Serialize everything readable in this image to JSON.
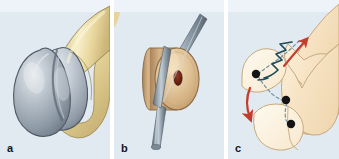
{
  "figure": {
    "background_color": "#ffffff",
    "panel_background_color": "#e1e9f1",
    "width": 339,
    "height": 159
  },
  "panels": [
    {
      "id": "a",
      "label": "a",
      "caption": "Distal femur with articular cartilage defect on condyle",
      "colors": {
        "bone": "#e9d79b",
        "bone_light": "#f5ecc4",
        "bone_shadow": "#c9b478",
        "cartilage": "#9aa5b0",
        "cartilage_light": "#d8dde3",
        "cartilage_shadow": "#6f7a87",
        "outline": "#4a5560"
      },
      "parts": [
        {
          "name": "femoral-shaft",
          "tissue": "bone"
        },
        {
          "name": "medial-condyle",
          "tissue": "cartilage"
        },
        {
          "name": "lateral-condyle",
          "tissue": "cartilage"
        },
        {
          "name": "intercondylar-notch",
          "tissue": "cartilage"
        }
      ]
    },
    {
      "id": "b",
      "label": "b",
      "caption": "Harvested osteochondral plug on delivery tube",
      "colors": {
        "plug_face": "#dcb98d",
        "plug_face_light": "#edd6ae",
        "plug_rim": "#c9a273",
        "plug_center": "#7d2d1c",
        "rod": "#8a99a5",
        "rod_light": "#b7c3cc",
        "rod_shadow": "#5e6d79",
        "outline": "#7c6a4f"
      },
      "parts": [
        {
          "name": "graft-plug-cylinder",
          "tissue": "cancellous-bone"
        },
        {
          "name": "graft-plug-core",
          "tissue": "marrow"
        },
        {
          "name": "delivery-rod",
          "tissue": "instrument"
        }
      ]
    },
    {
      "id": "c",
      "label": "c",
      "caption": "Schematic of graft transfer from donor site to recipient defect",
      "colors": {
        "bone_fill": "#f7e4c5",
        "bone_fill_light": "#fdf3e0",
        "bone_outline": "#c8a97e",
        "arrow_red": "#c33d2c",
        "arrow_teal": "#1f4a58",
        "dot": "#141414",
        "dashed": "#6f93a3"
      },
      "markers": [
        {
          "name": "donor-site-marker-upper",
          "x": 28,
          "y": 74
        },
        {
          "name": "recipient-site-marker-mid",
          "x": 58,
          "y": 100
        },
        {
          "name": "recipient-site-marker-lower",
          "x": 63,
          "y": 123
        }
      ],
      "arrows": [
        {
          "name": "harvest-arrow-red-up",
          "color": "#c33d2c",
          "direction": "up-right"
        },
        {
          "name": "transfer-arrow-red-down",
          "color": "#c33d2c",
          "direction": "down-left"
        },
        {
          "name": "tunnel-path-teal",
          "color": "#1f4a58",
          "direction": "zigzag"
        }
      ],
      "parts": [
        {
          "name": "femoral-condyle-outline",
          "tissue": "bone"
        },
        {
          "name": "patella-outline",
          "tissue": "bone"
        },
        {
          "name": "trochlea-outline",
          "tissue": "bone"
        }
      ]
    }
  ]
}
